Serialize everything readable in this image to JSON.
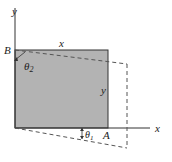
{
  "diagram": {
    "type": "shear-strain-deformation",
    "colors": {
      "fill": "#b3b3b3",
      "line": "#333333",
      "dashed": "#555555",
      "background": "#ffffff"
    },
    "labels": {
      "y_axis": "y",
      "x_axis": "x",
      "corner_top_left": "B",
      "corner_bottom_right": "A",
      "top_side": "x",
      "right_side": "y",
      "angle_top": "θ",
      "angle_top_sub": "2",
      "angle_bottom": "θ",
      "angle_bottom_sub": "1"
    }
  }
}
